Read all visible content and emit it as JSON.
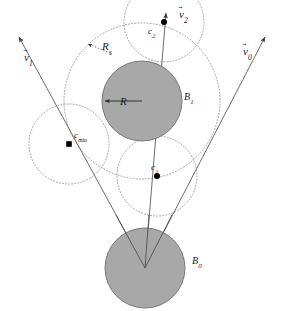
{
  "figure": {
    "width": 282,
    "height": 311,
    "background": "#ffffff"
  },
  "colors": {
    "ball_fill": "#a8a8a8",
    "ball_stroke": "#6e6e6e",
    "dotted_stroke": "#8d8d8d",
    "line_stroke": "#5a5a5a",
    "text": "#1a1a1a",
    "marker": "#000000"
  },
  "vectors": [
    {
      "id": "v1",
      "label_base": "v",
      "label_sub": "1",
      "label": "v1",
      "label_x": 24,
      "label_y": 52,
      "from_x": 145,
      "from_y": 268,
      "to_x": 16,
      "to_y": 33
    },
    {
      "id": "v2",
      "label_base": "v",
      "label_sub": "2",
      "label": "v2",
      "label_x": 179,
      "label_y": 9,
      "from_x": 145,
      "from_y": 268,
      "to_x": 166,
      "to_y": 9
    },
    {
      "id": "v0",
      "label_base": "v",
      "label_sub": "0",
      "label": "v0",
      "label_x": 243,
      "label_y": 46,
      "from_x": 145,
      "from_y": 268,
      "to_x": 268,
      "to_y": 33
    }
  ],
  "balls": [
    {
      "id": "B1",
      "label_base": "B",
      "label_sub": "1",
      "label": "B1",
      "label_x": 184,
      "label_y": 92,
      "cx": 142,
      "cy": 101,
      "r": 40,
      "role": "upper-ball"
    },
    {
      "id": "B0",
      "label_base": "B",
      "label_sub": "0",
      "label": "B0",
      "label_x": 192,
      "label_y": 256,
      "cx": 145,
      "cy": 268,
      "r": 40,
      "role": "lower-ball"
    }
  ],
  "points": [
    {
      "id": "cmin",
      "label_base": "c",
      "label_sub": "min",
      "label": "cmin",
      "label_x": 74,
      "label_y": 131,
      "x": 69,
      "y": 144,
      "marker": "square"
    },
    {
      "id": "c1",
      "label_base": "c",
      "label_sub": "1",
      "label": "c1",
      "label_x": 151,
      "label_y": 163,
      "x": 157,
      "y": 176,
      "marker": "dot"
    },
    {
      "id": "c2",
      "label_base": "c",
      "label_sub": "2",
      "label": "c2",
      "label_x": 148,
      "label_y": 27,
      "x": 164,
      "y": 22,
      "marker": "dot"
    }
  ],
  "radii": [
    {
      "id": "Rs",
      "label_base": "R",
      "label_sub": "s",
      "label": "Rs",
      "label_x": 102,
      "label_y": 41,
      "arrow_from_x": 112,
      "arrow_from_y": 52,
      "arrow_to_x": 87,
      "arrow_to_y": 43,
      "describes": "outer-swept-circle-radius"
    },
    {
      "id": "R",
      "label_base": "R",
      "label_sub": "",
      "label": "R",
      "label_x": 120,
      "label_y": 96,
      "arrow_from_x": 142,
      "arrow_from_y": 101,
      "arrow_to_x": 104,
      "arrow_to_y": 101,
      "describes": "ball-radius"
    }
  ],
  "dotted_circles": [
    {
      "id": "outer-swept-circle",
      "cx": 142,
      "cy": 101,
      "r": 78
    },
    {
      "id": "circle-at-cmin",
      "cx": 69,
      "cy": 144,
      "r": 40
    },
    {
      "id": "circle-at-c1",
      "cx": 157,
      "cy": 176,
      "r": 40
    },
    {
      "id": "circle-at-c2",
      "cx": 164,
      "cy": 22,
      "r": 40
    }
  ]
}
